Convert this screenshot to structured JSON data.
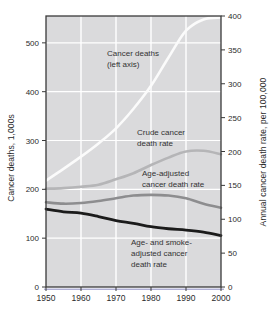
{
  "figure": {
    "bg": "#ffffff",
    "plot_bg": "#dadadc",
    "grid_color": "#ffffff",
    "axis_color": "#3a3a3a",
    "axis_underline_color": "#8d8dc4",
    "text_color": "#2b2b2b"
  },
  "annotations": [
    {
      "name": "cancer-deaths-label",
      "lines": [
        "Cancer deaths",
        "(left axis)"
      ],
      "x": 107,
      "y": 48
    },
    {
      "name": "crude-rate-label",
      "lines": [
        "Crude cancer",
        "death rate"
      ],
      "x": 137,
      "y": 127
    },
    {
      "name": "age-adjusted-label",
      "lines": [
        "Age-adjusted",
        "cancer death rate"
      ],
      "x": 142,
      "y": 168
    },
    {
      "name": "age-smoke-adjusted-label",
      "lines": [
        "Age- and smoke-",
        "adjusted cancer",
        "death rate"
      ],
      "x": 131,
      "y": 237
    }
  ],
  "chart_data": {
    "type": "line",
    "title": "",
    "x": [
      1950,
      1955,
      1960,
      1965,
      1970,
      1975,
      1980,
      1985,
      1990,
      1995,
      2000
    ],
    "x_ticks": [
      "1950",
      "1960",
      "1970",
      "1980",
      "1990",
      "2000"
    ],
    "x_range": [
      1950,
      2000
    ],
    "grid": true,
    "legend_position": "inline-annotations",
    "left_axis": {
      "label": "Cancer deaths, 1,000s",
      "ticks": [
        0,
        100,
        200,
        300,
        400,
        500
      ],
      "range": [
        0,
        555
      ]
    },
    "right_axis": {
      "label": "Annual cancer death rate, per 100,000",
      "ticks": [
        0,
        50,
        100,
        150,
        200,
        250,
        300,
        350,
        400
      ],
      "range": [
        0,
        400
      ]
    },
    "series": [
      {
        "name": "Cancer deaths (left axis)",
        "axis": "left",
        "color": "#fbfbfb",
        "width": 2.6,
        "values": [
          218,
          242,
          267,
          294,
          325,
          365,
          412,
          470,
          525,
          548,
          552
        ]
      },
      {
        "name": "Crude cancer death rate",
        "axis": "right",
        "color": "#b5b5b7",
        "width": 2.6,
        "values": [
          145,
          146,
          148,
          151,
          159,
          168,
          180,
          191,
          200,
          201,
          196
        ]
      },
      {
        "name": "Age-adjusted cancer death rate",
        "axis": "right",
        "color": "#8d8d8f",
        "width": 2.6,
        "values": [
          125,
          123,
          124,
          127,
          131,
          135,
          136,
          135,
          131,
          123,
          117
        ]
      },
      {
        "name": "Age- and smoke-adjusted cancer death rate",
        "axis": "right",
        "color": "#1b1b1b",
        "width": 2.8,
        "values": [
          115,
          111,
          109,
          104,
          98,
          94,
          89,
          86,
          84,
          81,
          76
        ]
      }
    ]
  }
}
